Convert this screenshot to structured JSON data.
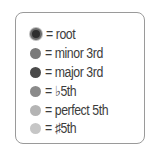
{
  "legend": {
    "items": [
      {
        "label": "= root",
        "color": "#2e2e2e",
        "kind": "root"
      },
      {
        "label": "= minor 3rd",
        "color": "#7a7a7a",
        "kind": "minor-3rd"
      },
      {
        "label": "= major 3rd",
        "color": "#4a4a4a",
        "kind": "major-3rd"
      },
      {
        "label": "= ♭5th",
        "color": "#8a8a8a",
        "kind": "flat-5th"
      },
      {
        "label": "= perfect 5th",
        "color": "#b4b4b4",
        "kind": "perfect-5th"
      },
      {
        "label": "= ♯5th",
        "color": "#c6c6c6",
        "kind": "sharp-5th"
      }
    ]
  }
}
